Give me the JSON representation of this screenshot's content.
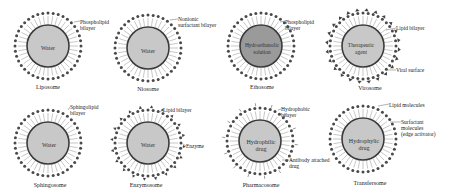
{
  "colors": {
    "background": "#ffffff",
    "core_light": "#c8c8c8",
    "core_dark": "#9a9a9a",
    "membrane": "#3a3a3a",
    "head": "#4a4a4a",
    "tail": "#b0b0b0",
    "text": "#222222"
  },
  "vesicles": [
    {
      "id": "liposome",
      "name": "Liposome",
      "core_text": "Water",
      "core_style": "light",
      "surface": "plain",
      "labels": [
        "Phospholipid\nbilayer"
      ]
    },
    {
      "id": "niosome",
      "name": "Niosome",
      "core_text": "Water",
      "core_style": "light",
      "surface": "plain",
      "labels": [
        "Nonionic\nsurfactant bilayer"
      ]
    },
    {
      "id": "ethosome",
      "name": "Ethosome",
      "core_text": "Hydroethanolic\nsolution",
      "core_style": "dark",
      "surface": "plain",
      "labels": [
        "Phospholipid\nbilayer"
      ]
    },
    {
      "id": "virosome",
      "name": "Virosome",
      "core_text": "Therapeutic\nagent",
      "core_style": "light",
      "surface": "viral",
      "labels": [
        "Lipid bilayer",
        "Viral surface"
      ]
    },
    {
      "id": "sphingosome",
      "name": "Sphingosome",
      "core_text": "Water",
      "core_style": "light",
      "surface": "plain",
      "labels": [
        "Sphingolipid\nbilayer"
      ]
    },
    {
      "id": "enzymosome",
      "name": "Enzymosome",
      "core_text": "Water",
      "core_style": "light",
      "surface": "enzyme",
      "labels": [
        "Lipid bilayer",
        "Enzyme"
      ]
    },
    {
      "id": "pharmacosome",
      "name": "Pharmacosome",
      "core_text": "Hydrophilic\ndrug",
      "core_style": "light",
      "surface": "antibody",
      "labels": [
        "Hydrophobic\nbilayer",
        "Antibody attached\ndrug"
      ]
    },
    {
      "id": "transfersome",
      "name": "Transfersome",
      "core_text": "Hydrophylic\ndrug",
      "core_style": "light",
      "surface": "plain",
      "labels": [
        "Lipid molecules",
        "Surfactant\nmolecules\n(edge activator)"
      ]
    }
  ]
}
